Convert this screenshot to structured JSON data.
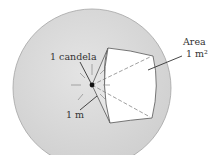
{
  "diagram": {
    "labels": {
      "source": "1 candela",
      "radius": "1 m",
      "area_word": "Area",
      "area_value": "1 m²"
    },
    "colors": {
      "sphere_fill": "#d6d6d6",
      "sphere_stroke": "#9a9a9a",
      "patch_fill": "#ffffff",
      "cone_fill": "#e2e2e2",
      "line": "#333333"
    }
  }
}
